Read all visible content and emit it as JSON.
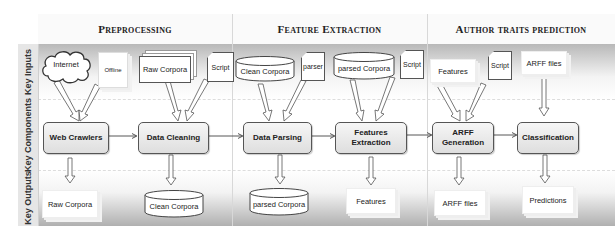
{
  "phases": [
    {
      "label": "Preprocessing"
    },
    {
      "label": "Feature Extraction"
    },
    {
      "label": "Author traits prediction"
    }
  ],
  "lanes": [
    {
      "label": "Key Inputs"
    },
    {
      "label": "Key Components"
    },
    {
      "label": "Key Outputs"
    }
  ],
  "inputs": {
    "internet": "Internet",
    "offline": "Offline",
    "raw_corpora": "Raw Corpora",
    "script1": "Script",
    "clean_corpora": "Clean Corpora",
    "parser": "parser",
    "parsed_corpora": "parsed Corpora",
    "script2": "Script",
    "features": "Features",
    "script3": "Script",
    "arff_files": "ARFF files"
  },
  "components": {
    "web_crawlers": "Web Crawlers",
    "data_cleaning": "Data Cleaning",
    "data_parsing": "Data Parsing",
    "features_extraction_1": "Features",
    "features_extraction_2": "Extraction",
    "arff_generation_1": "ARFF",
    "arff_generation_2": "Generation",
    "classification": "Classification"
  },
  "outputs": {
    "raw_corpora": "Raw Corpora",
    "clean_corpora": "Clean Corpora",
    "parsed_corpora": "parsed Corpora",
    "features": "Features",
    "arff_files": "ARFF files",
    "predictions": "Predictions"
  },
  "colors": {
    "band_dark": "#b5b5b5",
    "band_light": "#ffffff",
    "component_border": "#555555"
  }
}
